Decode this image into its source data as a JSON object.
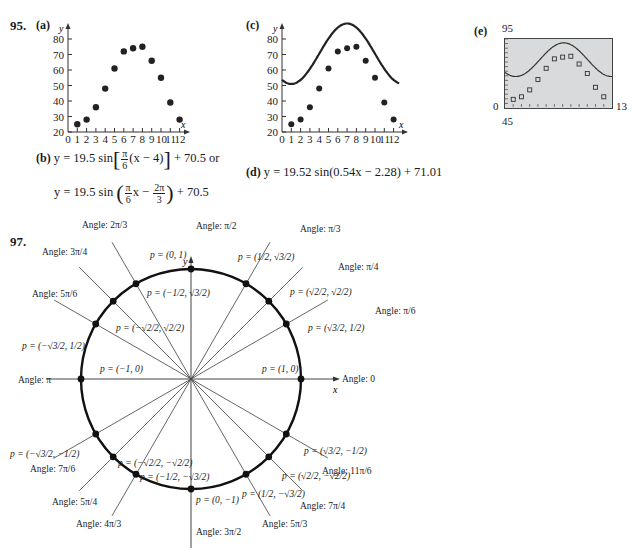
{
  "problem95": {
    "number": "95.",
    "part_a": {
      "label": "(a)",
      "ylabel": "y",
      "xlabel": "x",
      "yticks": [
        "80",
        "70",
        "60",
        "50",
        "40",
        "30",
        "20"
      ],
      "xticks": [
        "0",
        "1",
        "2",
        "3",
        "4",
        "5",
        "6",
        "7",
        "8",
        "9",
        "10",
        "11",
        "12"
      ]
    },
    "part_b": {
      "label": "(b)",
      "line1_prefix": "y = 19.5 sin",
      "line1_frac_num": "π",
      "line1_frac_den": "6",
      "line1_inner": "(x − 4)",
      "line1_suffix": "+ 70.5 or",
      "line2_prefix": "y = 19.5 sin",
      "line2_frac1_num": "π",
      "line2_frac1_den": "6",
      "line2_mid": "x −",
      "line2_frac2_num": "2π",
      "line2_frac2_den": "3",
      "line2_suffix": "+ 70.5"
    },
    "part_c": {
      "label": "(c)",
      "ylabel": "y",
      "xlabel": "x",
      "yticks": [
        "80",
        "70",
        "60",
        "50",
        "40",
        "30",
        "20"
      ],
      "xticks": [
        "0",
        "1",
        "2",
        "3",
        "4",
        "5",
        "6",
        "7",
        "8",
        "9",
        "10",
        "11",
        "12"
      ]
    },
    "part_d": {
      "label": "(d)",
      "equation": "y = 19.52 sin(0.54x − 2.28) + 71.01"
    },
    "part_e": {
      "label": "(e)",
      "ymax": "95",
      "ymin": "45",
      "xmin": "0",
      "xmax": "13"
    }
  },
  "problem97": {
    "number": "97.",
    "axis_y": "y",
    "axis_x": "x",
    "points": [
      {
        "angle": "0",
        "p": "(1, 0)"
      },
      {
        "angle": "π/6",
        "p": "(√3/2, 1/2)"
      },
      {
        "angle": "π/4",
        "p": "(√2/2, √2/2)"
      },
      {
        "angle": "π/3",
        "p": "(1/2, √3/2)"
      },
      {
        "angle": "π/2",
        "p": "(0, 1)"
      },
      {
        "angle": "2π/3",
        "p": "(−1/2, √3/2)"
      },
      {
        "angle": "3π/4",
        "p": "(−√2/2, √2/2)"
      },
      {
        "angle": "5π/6",
        "p": "(−√3/2, 1/2)"
      },
      {
        "angle": "π",
        "p": "(−1, 0)"
      },
      {
        "angle": "7π/6",
        "p": "(−√3/2, −1/2)"
      },
      {
        "angle": "5π/4",
        "p": "(−√2/2, −√2/2)"
      },
      {
        "angle": "4π/3",
        "p": "(−1/2, −√3/2)"
      },
      {
        "angle": "3π/2",
        "p": "(0, −1)"
      },
      {
        "angle": "5π/3",
        "p": "(1/2, −√3/2)"
      },
      {
        "angle": "7π/4",
        "p": "(√2/2, −√2/2)"
      },
      {
        "angle": "11π/6",
        "p": "(√3/2, −1/2)"
      }
    ]
  },
  "chart_data": [
    {
      "type": "scatter",
      "title": "95 (a)",
      "xlabel": "x",
      "ylabel": "y",
      "x": [
        1,
        2,
        3,
        4,
        5,
        6,
        7,
        8,
        9,
        10,
        11,
        12
      ],
      "values": [
        25,
        28,
        36,
        48,
        61,
        72,
        74,
        75,
        66,
        55,
        39,
        28
      ],
      "xlim": [
        0,
        12.5
      ],
      "ylim": [
        20,
        85
      ],
      "grid": false
    },
    {
      "type": "line",
      "title": "95 (c)",
      "xlabel": "x",
      "ylabel": "y",
      "series": [
        {
          "name": "data",
          "x": [
            1,
            2,
            3,
            4,
            5,
            6,
            7,
            8,
            9,
            10,
            11,
            12
          ],
          "values": [
            25,
            28,
            36,
            48,
            61,
            72,
            74,
            75,
            66,
            55,
            39,
            28
          ]
        },
        {
          "name": "fit y = 19.5 sin(π/6(x−4)) + 70.5",
          "x": [
            0,
            1,
            2,
            3,
            4,
            5,
            6,
            7,
            8,
            9,
            10,
            11,
            12,
            12.5
          ],
          "values": [
            30,
            25,
            28,
            36,
            48,
            61,
            72,
            75,
            74,
            66,
            54,
            39,
            28,
            24
          ]
        }
      ],
      "xlim": [
        0,
        12.5
      ],
      "ylim": [
        20,
        85
      ],
      "grid": false
    },
    {
      "type": "line",
      "title": "95 (e)",
      "series": [
        {
          "name": "data",
          "x": [
            1,
            2,
            3,
            4,
            5,
            6,
            7,
            8,
            9,
            10,
            11,
            12
          ],
          "values": [
            25,
            28,
            36,
            48,
            61,
            72,
            74,
            75,
            66,
            55,
            39,
            28
          ]
        },
        {
          "name": "fit y = 19.52 sin(0.54x − 2.28) + 71.01"
        }
      ],
      "xlim": [
        0,
        13
      ],
      "ylim": [
        45,
        95
      ],
      "grid": false
    }
  ]
}
